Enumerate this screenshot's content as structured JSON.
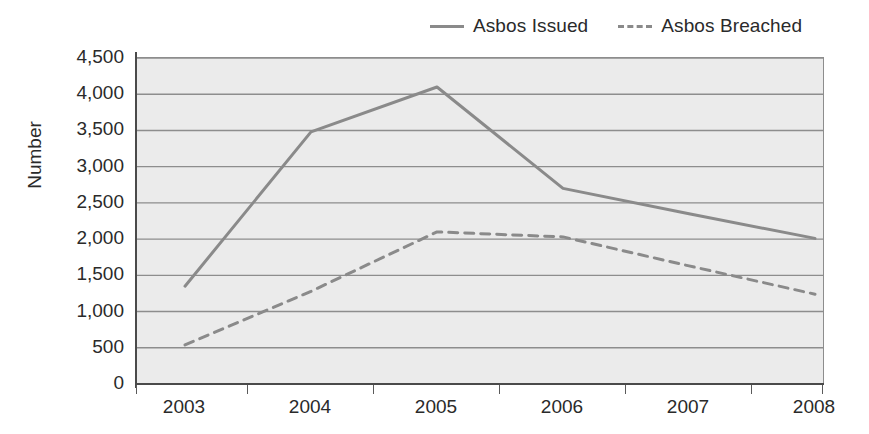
{
  "legend": {
    "position": "top-right",
    "entries": [
      {
        "label": "Asbos Issued",
        "style": "solid",
        "icon": "solid-line-icon"
      },
      {
        "label": "Asbos Breached",
        "style": "dashed",
        "icon": "dashed-line-icon"
      }
    ]
  },
  "axes": {
    "y_title": "Number",
    "y_ticks": [
      "0",
      "500",
      "1,000",
      "1,500",
      "2,000",
      "2,500",
      "3,000",
      "3,500",
      "4,000",
      "4,500"
    ],
    "x_ticks": [
      "2003",
      "2004",
      "2005",
      "2006",
      "2007",
      "2008"
    ]
  },
  "colors": {
    "plot_background": "#ebebeb",
    "gridline": "#8d8d8d",
    "series_line": "#8a8a8a",
    "axis": "#4a4a4a",
    "text": "#2a2a2a"
  },
  "chart_data": {
    "type": "line",
    "title": "",
    "subtitle": "",
    "xlabel": "",
    "ylabel": "Number",
    "categories": [
      "2003",
      "2004",
      "2005",
      "2006",
      "2007",
      "2008"
    ],
    "series": [
      {
        "name": "Asbos Issued",
        "style": "solid",
        "color": "#8a8a8a",
        "values": [
          1350,
          3480,
          4100,
          2700,
          2350,
          2010
        ]
      },
      {
        "name": "Asbos Breached",
        "style": "dashed",
        "color": "#8a8a8a",
        "values": [
          540,
          1280,
          2100,
          2030,
          1630,
          1240
        ]
      }
    ],
    "ylim": [
      0,
      4500
    ],
    "ytick_step": 500,
    "grid": true,
    "grid_axis": "y",
    "legend_position": "top-right"
  }
}
